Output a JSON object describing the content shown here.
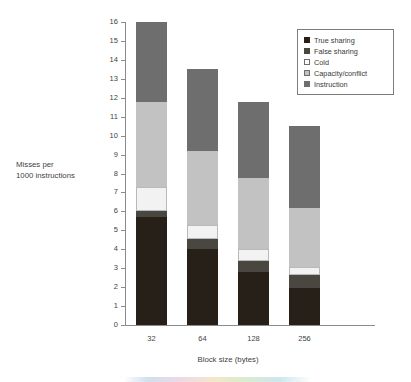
{
  "chart_data": {
    "type": "bar",
    "subtype": "stacked-bar",
    "title": "",
    "xlabel": "Block size (bytes)",
    "ylabel": "Misses per 1000 instructions",
    "ylabel_line1": "Misses per",
    "ylabel_line2": "1000 instructions",
    "categories": [
      "32",
      "64",
      "128",
      "256"
    ],
    "ylim": [
      0,
      16
    ],
    "ytick_labels": [
      "0",
      "1",
      "2",
      "3",
      "4",
      "5",
      "6",
      "7",
      "8",
      "9",
      "10",
      "11",
      "12",
      "13",
      "14",
      "15",
      "16"
    ],
    "yticks": [
      0,
      1,
      2,
      3,
      4,
      5,
      6,
      7,
      8,
      9,
      10,
      11,
      12,
      13,
      14,
      15,
      16
    ],
    "grid": false,
    "legend_position": "top-right",
    "stack_order_bottom_to_top": [
      "True sharing",
      "False sharing",
      "Cold",
      "Capacity/conflict",
      "Instruction"
    ],
    "series": [
      {
        "name": "True sharing",
        "color": "#262018",
        "values": [
          5.7,
          4.0,
          2.8,
          1.95
        ]
      },
      {
        "name": "False sharing",
        "color": "#4a4640",
        "values": [
          0.3,
          0.55,
          0.6,
          0.7
        ]
      },
      {
        "name": "Cold",
        "color": "#f2f2f2",
        "values": [
          1.3,
          0.75,
          0.6,
          0.4
        ]
      },
      {
        "name": "Capacity/conflict",
        "color": "#c2c2c2",
        "values": [
          4.5,
          3.9,
          3.75,
          3.15
        ]
      },
      {
        "name": "Instruction",
        "color": "#6e6e6e",
        "values": [
          4.2,
          4.3,
          4.05,
          4.3
        ]
      }
    ],
    "bar_totals": [
      16.0,
      13.5,
      11.8,
      10.5
    ]
  },
  "legend": {
    "items": [
      {
        "label": "True sharing",
        "color": "#262018",
        "outlined": false
      },
      {
        "label": "False sharing",
        "color": "#4a4640",
        "outlined": false
      },
      {
        "label": "Cold",
        "color": "#ffffff",
        "outlined": true
      },
      {
        "label": "Capacity/conflict",
        "color": "#c2c2c2",
        "outlined": true
      },
      {
        "label": "Instruction",
        "color": "#6e6e6e",
        "outlined": false
      }
    ]
  },
  "colors": {
    "axis": "#8c8c8c",
    "text": "#3f3f3f",
    "legend_border": "#7d7d7d",
    "background": "#ffffff"
  }
}
